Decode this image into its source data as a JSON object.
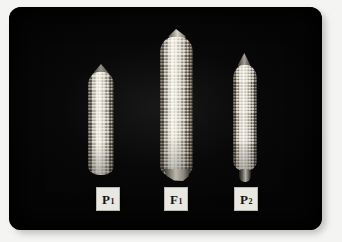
{
  "figure": {
    "background_color": "#f4f4f2",
    "photo_background_color": "#050505",
    "label_card_color": "#e8e7e2",
    "label_text_color": "#131313"
  },
  "specimens": [
    {
      "id": "p1",
      "label_main": "P",
      "label_sub": "1",
      "label_full": "P1",
      "role": "parent-inbred-one",
      "position": "left",
      "relative_size": "medium",
      "tip_shape": "tapered-conical"
    },
    {
      "id": "f1",
      "label_main": "F",
      "label_sub": "1",
      "label_full": "F1",
      "role": "hybrid-offspring",
      "position": "center",
      "relative_size": "largest",
      "tip_shape": "broad-rounded"
    },
    {
      "id": "p2",
      "label_main": "P",
      "label_sub": "2",
      "label_full": "P2",
      "role": "parent-inbred-two",
      "position": "right",
      "relative_size": "smallest",
      "tip_shape": "sharply-pointed"
    }
  ]
}
